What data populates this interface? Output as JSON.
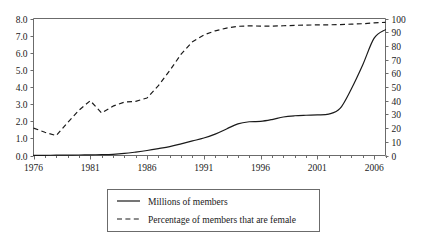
{
  "chart_data": {
    "type": "line",
    "title": "",
    "subtitle": "",
    "xlabel": "",
    "ylabel": "",
    "y2label": "",
    "grid": false,
    "legend_position": "bottom",
    "x": [
      1976,
      1977,
      1978,
      1979,
      1980,
      1981,
      1982,
      1983,
      1984,
      1985,
      1986,
      1987,
      1988,
      1989,
      1990,
      1991,
      1992,
      1993,
      1994,
      1995,
      1996,
      1997,
      1998,
      1999,
      2000,
      2001,
      2002,
      2003,
      2004,
      2005,
      2006,
      2007
    ],
    "xlim": [
      1976,
      2007
    ],
    "xticks": [
      1976,
      1981,
      1986,
      1991,
      1996,
      2001,
      2006
    ],
    "xtick_labels": [
      "1976",
      "1981",
      "1986",
      "1991",
      "1996",
      "2001",
      "2006"
    ],
    "xminor_ticks_every": 1,
    "ylim": [
      0.0,
      8.0
    ],
    "yticks": [
      0.0,
      1.0,
      2.0,
      3.0,
      4.0,
      5.0,
      6.0,
      7.0,
      8.0
    ],
    "ytick_labels": [
      "0.0",
      "1.0",
      "2.0",
      "3.0",
      "4.0",
      "5.0",
      "6.0",
      "7.0",
      "8.0"
    ],
    "y2lim": [
      0,
      100
    ],
    "y2ticks": [
      0,
      10,
      20,
      30,
      40,
      50,
      60,
      70,
      80,
      90,
      100
    ],
    "y2tick_labels": [
      "0",
      "10",
      "20",
      "30",
      "40",
      "50",
      "60",
      "70",
      "80",
      "90",
      "100"
    ],
    "series": [
      {
        "name": "Millions of members",
        "axis": "left",
        "style": "solid",
        "color": "#1a1a1a",
        "values": [
          0.01,
          0.01,
          0.02,
          0.02,
          0.03,
          0.04,
          0.05,
          0.07,
          0.12,
          0.2,
          0.29,
          0.4,
          0.52,
          0.68,
          0.85,
          1.02,
          1.25,
          1.55,
          1.85,
          1.97,
          1.99,
          2.1,
          2.25,
          2.32,
          2.35,
          2.37,
          2.42,
          2.75,
          3.9,
          5.3,
          6.85,
          7.35
        ]
      },
      {
        "name": "Percentage of members that are female",
        "axis": "right",
        "style": "dashed",
        "color": "#1a1a1a",
        "values": [
          20,
          17,
          14.5,
          24,
          33,
          40,
          31,
          36,
          39,
          39.5,
          42,
          51,
          62,
          74,
          83,
          88,
          91,
          93,
          94.3,
          94.6,
          94.5,
          94.4,
          94.7,
          95,
          95.2,
          95.3,
          95.4,
          95.6,
          95.9,
          96.2,
          96.8,
          97.2
        ]
      }
    ]
  },
  "legend": {
    "items": [
      {
        "label": "Millions of members",
        "style": "solid"
      },
      {
        "label": "Percentage of members that are female",
        "style": "dashed"
      }
    ]
  }
}
